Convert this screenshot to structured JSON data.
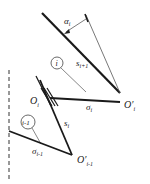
{
  "diagram": {
    "labels": {
      "alpha": "α",
      "alpha_sub": "i",
      "s_next": "s",
      "s_next_sub": "i+1",
      "circle_i": "i",
      "s_cur": "s",
      "s_cur_sub": "i",
      "O_i": "O",
      "O_i_sub": "i",
      "sigma_i": "σ",
      "sigma_i_sub": "i",
      "O_prime_i": "O′",
      "O_prime_i_sub": "i",
      "circle_i_minus_1": "i-1",
      "sigma_prev": "σ",
      "sigma_prev_sub": "i-1",
      "O_prime_prev": "O′",
      "O_prime_prev_sub": "i-1"
    },
    "colors": {
      "line": "#1a1a1a",
      "thin": "#555555",
      "background": "#ffffff"
    }
  }
}
